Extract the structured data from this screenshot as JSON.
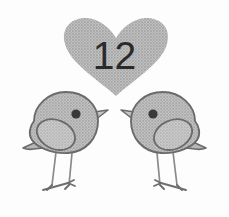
{
  "illustration": {
    "title": "Two birds facing each other beneath a heart",
    "background_color": "#fdfdfd",
    "heart": {
      "name": "heart-shape",
      "fill_color": "#b2b2b2",
      "texture": "halftone-dots",
      "count_text": "12",
      "count_text_color": "#2a2a2a",
      "bounds": {
        "x": 63,
        "y": 18,
        "width": 106,
        "height": 80
      }
    },
    "birds": [
      {
        "name": "bird-left",
        "facing": "right",
        "body_fill_color": "#b4b4b4",
        "outline_color": "#6a6a6a",
        "wing_fill_color": "#bcbcbc",
        "eye_color": "#3a3a3a",
        "beak_fill_color": "#c6c6c6",
        "leg_color": "#8a8a8a",
        "bounds": {
          "x": 22,
          "y": 90,
          "width": 86,
          "height": 102
        }
      },
      {
        "name": "bird-right",
        "facing": "left",
        "body_fill_color": "#b4b4b4",
        "outline_color": "#6a6a6a",
        "wing_fill_color": "#bcbcbc",
        "eye_color": "#3a3a3a",
        "beak_fill_color": "#c6c6c6",
        "leg_color": "#8a8a8a",
        "bounds": {
          "x": 121,
          "y": 90,
          "width": 86,
          "height": 102
        }
      }
    ]
  }
}
